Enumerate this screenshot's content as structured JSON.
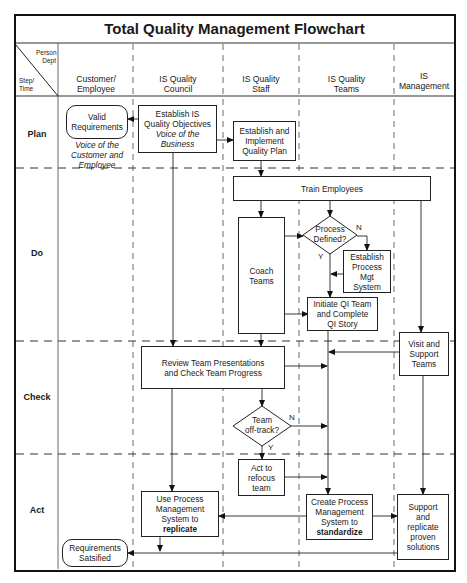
{
  "title": "Total Quality Management Flowchart",
  "corner": {
    "top": [
      "Person",
      "Dept"
    ],
    "bottom": [
      "Step/",
      "Time"
    ]
  },
  "columns": [
    {
      "label": "Customer/ Employee",
      "lines": [
        "Customer/",
        "Employee"
      ]
    },
    {
      "label": "IS Quality Council",
      "lines": [
        "IS Quality",
        "Council"
      ]
    },
    {
      "label": "IS Quality Staff",
      "lines": [
        "IS Quality",
        "Staff"
      ]
    },
    {
      "label": "IS Quality Teams",
      "lines": [
        "IS Quality",
        "Teams"
      ]
    },
    {
      "label": "IS Management",
      "lines": [
        "IS",
        "Management"
      ]
    }
  ],
  "rows": [
    "Plan",
    "Do",
    "Check",
    "Act"
  ],
  "nodes": {
    "valid_requirements": {
      "lines": [
        "Valid",
        "Requirements"
      ]
    },
    "voice_customer": {
      "lines": [
        "Voice of the",
        "Customer and",
        "Employee"
      ]
    },
    "establish_objectives": {
      "lines": [
        "Establish IS",
        "Quality Objectives"
      ],
      "italic": [
        "Voice of the",
        "Business"
      ]
    },
    "establish_plan": {
      "lines": [
        "Establish and",
        "Implement",
        "Quality Plan"
      ]
    },
    "train_employees": {
      "text": "Train  Employees"
    },
    "coach_teams": {
      "lines": [
        "Coach",
        "Teams"
      ]
    },
    "process_defined": {
      "lines": [
        "Process",
        "Defined?"
      ],
      "yes": "Y",
      "no": "N"
    },
    "establish_pms": {
      "lines": [
        "Establish",
        "Process",
        "Mgt",
        "System"
      ]
    },
    "initiate_qi": {
      "lines": [
        "Initiate QI Team",
        "and Complete",
        "QI Story"
      ]
    },
    "review_team": {
      "lines": [
        "Review Team Presentations",
        "and Check Team Progress"
      ]
    },
    "visit_support": {
      "lines": [
        "Visit and",
        "Support",
        "Teams"
      ]
    },
    "team_offtrack": {
      "lines": [
        "Team",
        "off-track?"
      ],
      "yes": "Y",
      "no": "N"
    },
    "act_refocus": {
      "lines": [
        "Act to",
        "refocus",
        "team"
      ]
    },
    "use_pms": {
      "lines": [
        "Use Process",
        "Management",
        "System to"
      ],
      "bold": "replicate"
    },
    "create_pms": {
      "lines": [
        "Create Process",
        "Management",
        "System to"
      ],
      "bold": "standardize"
    },
    "support_replicate": {
      "lines": [
        "Support",
        "and",
        "replicate",
        "proven",
        "solutions"
      ]
    },
    "requirements_satisfied": {
      "lines": [
        "Requirements",
        "Satsified"
      ]
    }
  },
  "colors": {
    "line": "#222222",
    "frame": "#111111",
    "background": "#ffffff"
  }
}
